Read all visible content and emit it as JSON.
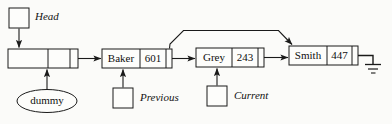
{
  "diagram": {
    "stroke_color": "#1a1a1a",
    "fill_color": "#fdfdfb",
    "background_color": "#fbfbf9"
  },
  "pointers": {
    "head": {
      "label": "Head",
      "icon": "pointer-box-icon"
    },
    "previous": {
      "label": "Previous",
      "icon": "pointer-box-icon"
    },
    "current": {
      "label": "Current",
      "icon": "pointer-box-icon"
    }
  },
  "dummy": {
    "label": "dummy",
    "shape": "ellipse"
  },
  "nodes": [
    {
      "name": "",
      "number": "",
      "is_dummy": true
    },
    {
      "name": "Baker",
      "number": "601",
      "is_dummy": false
    },
    {
      "name": "Grey",
      "number": "243",
      "is_dummy": false
    },
    {
      "name": "Smith",
      "number": "447",
      "is_dummy": false
    }
  ],
  "terminator": {
    "symbol": "ground-icon",
    "meaning": "null"
  },
  "links": [
    {
      "from": "dummy",
      "to": "Baker",
      "style": "straight-arrow"
    },
    {
      "from": "Baker",
      "to": "Grey",
      "style": "straight-arrow"
    },
    {
      "from": "Grey",
      "to": "Smith",
      "style": "straight-arrow"
    },
    {
      "from": "Baker",
      "to": "Smith",
      "style": "curved-overhead-arrow"
    },
    {
      "from": "Smith",
      "to": "null",
      "style": "ground"
    }
  ]
}
